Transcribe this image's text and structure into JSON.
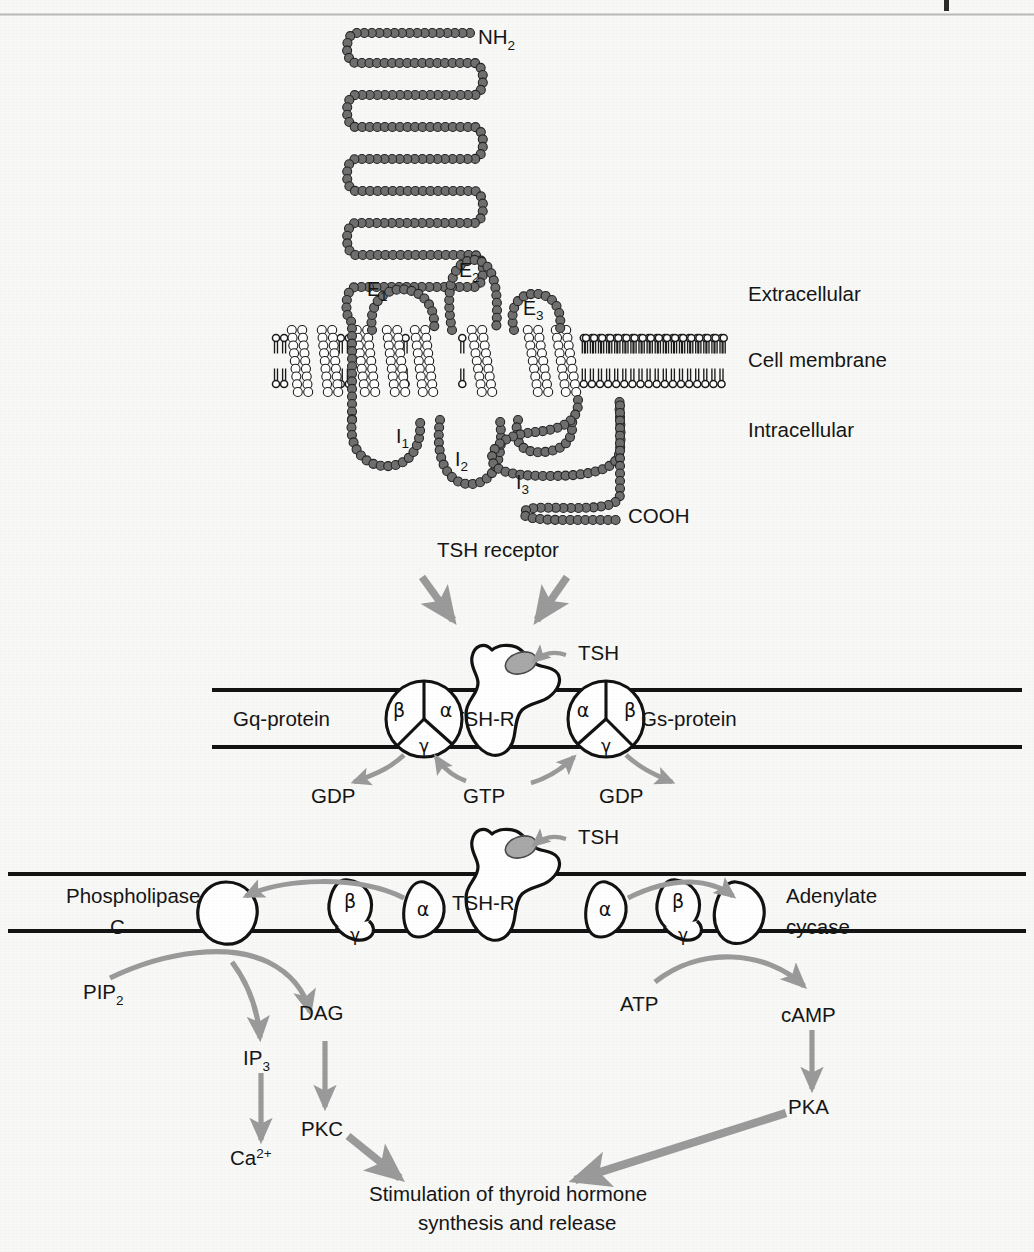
{
  "figure": {
    "background_color": "#f8f8f6",
    "arrow_gray": "#9a9a9a",
    "chain_gray": "#6f6f6f",
    "ink": "#151515"
  },
  "page_rule": {
    "visible": true
  },
  "receptor_panel": {
    "n_terminus": "NH",
    "n_terminus_sub": "2",
    "c_terminus": "COOH",
    "extracellular_loops": [
      {
        "label": "E",
        "sub": "1"
      },
      {
        "label": "E",
        "sub": "2"
      },
      {
        "label": "E",
        "sub": "3"
      }
    ],
    "intracellular_loops": [
      {
        "label": "I",
        "sub": "1"
      },
      {
        "label": "I",
        "sub": "2"
      },
      {
        "label": "I",
        "sub": "3"
      }
    ],
    "side_labels": [
      "Extracellular",
      "Cell membrane",
      "Intracellular"
    ],
    "caption": "TSH receptor"
  },
  "g_protein_panel": {
    "left_protein": "Gq-protein",
    "right_protein": "Gs-protein",
    "receptor": "TSH-R",
    "ligand": "TSH",
    "subunits": {
      "alpha": "α",
      "beta": "β",
      "gamma": "γ"
    },
    "nucleotides": {
      "left_released": "GDP",
      "center_bound": "GTP",
      "right_released": "GDP"
    }
  },
  "effector_panel": {
    "receptor": "TSH-R",
    "ligand": "TSH",
    "left_enzyme_line1": "Phospholipase",
    "left_enzyme_line2": "C",
    "right_enzyme_line1": "Adenylate",
    "right_enzyme_line2": "cycase",
    "subunits": {
      "alpha": "α",
      "beta": "β",
      "gamma": "γ"
    }
  },
  "cascade": {
    "left": {
      "substrate": "PIP",
      "substrate_sub": "2",
      "branch_a": {
        "name": "IP",
        "sub": "3"
      },
      "branch_a_product": {
        "name": "Ca",
        "sup": "2+"
      },
      "branch_b": {
        "name": "DAG"
      },
      "branch_b_product": {
        "name": "PKC"
      }
    },
    "right": {
      "substrate": "ATP",
      "product": "cAMP",
      "kinase": "PKA"
    }
  },
  "outcome": {
    "line1": "Stimulation of thyroid hormone",
    "line2": "synthesis and release"
  }
}
